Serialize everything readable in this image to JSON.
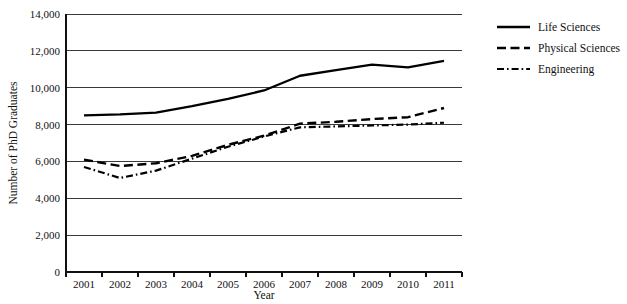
{
  "chart_data": {
    "type": "line",
    "title": "",
    "xlabel": "Year",
    "ylabel": "Number of PhD Graduates",
    "categories": [
      "2001",
      "2002",
      "2003",
      "2004",
      "2005",
      "2006",
      "2007",
      "2008",
      "2009",
      "2010",
      "2011"
    ],
    "ylim": [
      0,
      14000
    ],
    "ytick_step": 2000,
    "ytick_labels": [
      "0",
      "2,000",
      "4,000",
      "6,000",
      "8,000",
      "10,000",
      "12,000",
      "14,000"
    ],
    "ytick_values": [
      0,
      2000,
      4000,
      6000,
      8000,
      10000,
      12000,
      14000
    ],
    "grid": true,
    "grid_axis": "y",
    "legend_position": "right",
    "series": [
      {
        "name": "Life Sciences",
        "style": "solid",
        "color": "#000000",
        "values": [
          8500,
          8550,
          8650,
          9000,
          9400,
          9850,
          10650,
          10950,
          11250,
          11100,
          11450
        ]
      },
      {
        "name": "Physical Sciences",
        "style": "dashed",
        "color": "#000000",
        "values": [
          6100,
          5750,
          5900,
          6300,
          6900,
          7400,
          8050,
          8150,
          8300,
          8400,
          8900
        ]
      },
      {
        "name": "Engineering",
        "style": "dash-dot",
        "color": "#000000",
        "values": [
          5700,
          5100,
          5500,
          6150,
          6800,
          7350,
          7850,
          7900,
          7950,
          8000,
          8100
        ]
      }
    ]
  },
  "legend": {
    "items": [
      {
        "label": "Life Sciences",
        "style": "solid"
      },
      {
        "label": "Physical Sciences",
        "style": "dashed"
      },
      {
        "label": "Engineering",
        "style": "dash-dot"
      }
    ]
  },
  "axes": {
    "x_title": "Year",
    "y_title": "Number of PhD Graduates"
  }
}
